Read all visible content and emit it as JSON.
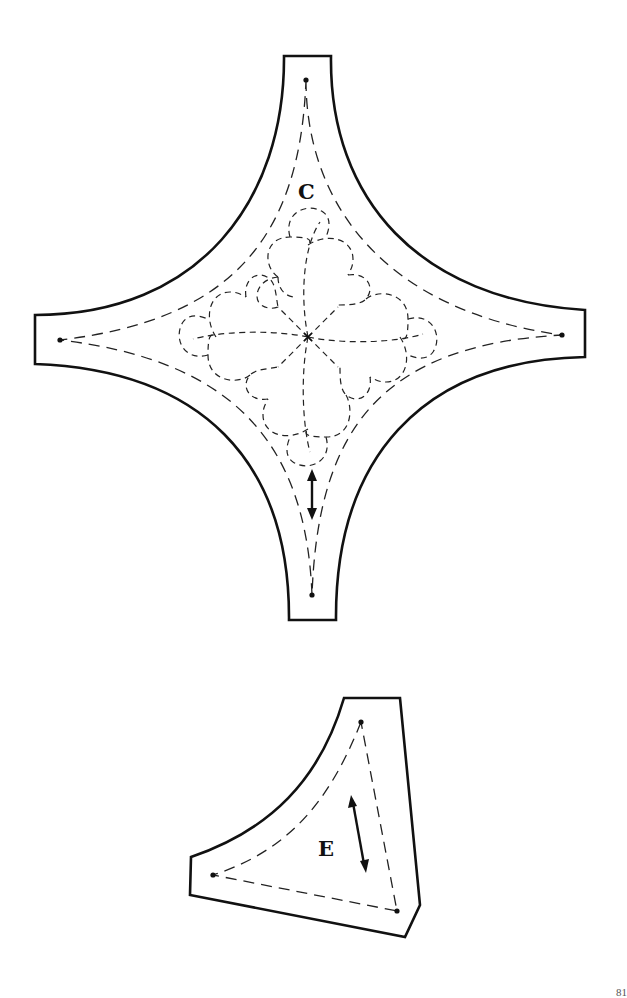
{
  "page": {
    "type": "quilt template sheet",
    "page_number": "81",
    "background": "#ffffff",
    "ink": "#111111"
  },
  "pieces": [
    {
      "id": "C",
      "label": "C",
      "shape": "four-pointed curved star (concave square with tabs)",
      "has_grain_arrow": true,
      "grain_direction": "vertical",
      "quilting_motif": "dashed eight-petal flower with scalloped outline",
      "seam_dots": 4
    },
    {
      "id": "E",
      "label": "E",
      "shape": "curved triangle with clipped corners",
      "has_grain_arrow": true,
      "grain_direction": "diagonal",
      "seam_dots": 3
    }
  ]
}
